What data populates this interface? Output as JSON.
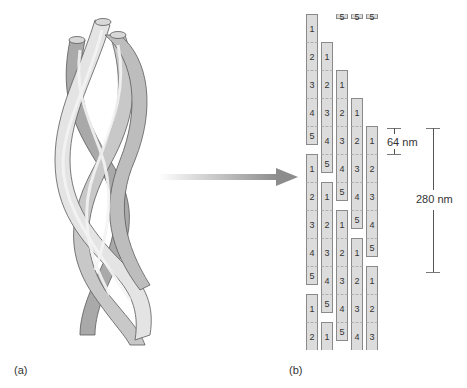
{
  "figure": {
    "panel_a_label": "(a)",
    "panel_b_label": "(b)",
    "panel_a_description": "triple-helix-collagen-molecule",
    "panel_b_description": "staggered-array-of-collagen-molecules",
    "scale_small_label": "64 nm",
    "scale_large_label": "280 nm",
    "colors": {
      "segment_fill": "#dcdcdc",
      "segment_border": "#8a8a8a",
      "arrow": "#8c8c8c",
      "helix_light": "#e4e4e4",
      "helix_mid": "#c8c8c8",
      "helix_dark": "#a9a9a9"
    }
  },
  "fibril": {
    "segment_height": 28,
    "columns": [
      {
        "x": 306,
        "molecules": [
          {
            "top": 14,
            "labels": [
              "1",
              "2",
              "3",
              "4",
              "5"
            ]
          },
          {
            "top": 154,
            "labels": [
              "1",
              "2",
              "3",
              "4",
              "5"
            ]
          },
          {
            "top": 294,
            "labels": [
              "1",
              "2"
            ]
          }
        ]
      },
      {
        "x": 321,
        "molecules": [
          {
            "top": -6,
            "labels": [
              "5"
            ]
          },
          {
            "top": 42,
            "labels": [
              "1",
              "2",
              "3",
              "4",
              "5"
            ]
          },
          {
            "top": 182,
            "labels": [
              "1",
              "2",
              "3",
              "4",
              "5"
            ]
          },
          {
            "top": 322,
            "labels": [
              "1"
            ]
          }
        ]
      },
      {
        "x": 336,
        "molecules": [
          {
            "top": -28,
            "labels": [
              "4",
              "5"
            ]
          },
          {
            "top": 70,
            "labels": [
              "1",
              "2",
              "3",
              "4",
              "5"
            ]
          },
          {
            "top": 210,
            "labels": [
              "1",
              "2",
              "3",
              "4",
              "5"
            ]
          }
        ]
      },
      {
        "x": 351,
        "molecules": [
          {
            "top": -56,
            "labels": [
              "3",
              "4",
              "5"
            ]
          },
          {
            "top": 98,
            "labels": [
              "1",
              "2",
              "3",
              "4",
              "5"
            ]
          },
          {
            "top": 238,
            "labels": [
              "1",
              "2",
              "3",
              "4"
            ]
          }
        ]
      },
      {
        "x": 366,
        "molecules": [
          {
            "top": -84,
            "labels": [
              "2",
              "3",
              "4",
              "5"
            ]
          },
          {
            "top": 126,
            "labels": [
              "1",
              "2",
              "3",
              "4",
              "5"
            ]
          },
          {
            "top": 266,
            "labels": [
              "1",
              "2",
              "3"
            ]
          }
        ]
      }
    ]
  }
}
